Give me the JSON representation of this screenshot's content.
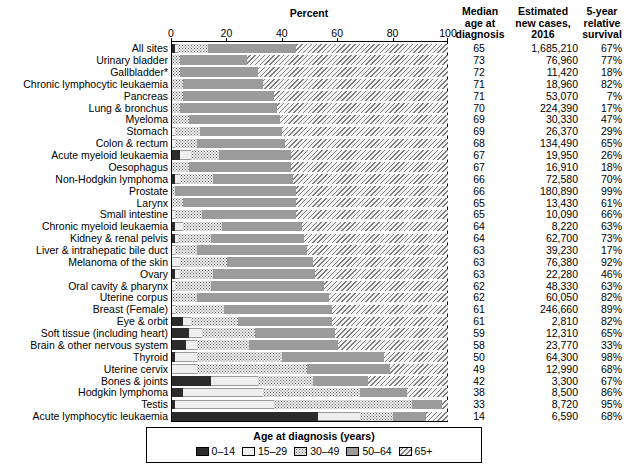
{
  "header": {
    "percent": "Percent",
    "median": "Median\nage at\ndiagnosis",
    "median_l1": "Median",
    "median_l2": "age at",
    "median_l3": "diagnosis",
    "cases_l1": "Estimated",
    "cases_l2": "new cases,",
    "cases_l3": "2016",
    "surv_l1": "5-year",
    "surv_l2": "relative",
    "surv_l3": "survival"
  },
  "legend": {
    "title": "Age at diagnosis (years)",
    "items": [
      {
        "label": "0–14",
        "swatch": "solid-dark",
        "color": "#2b2b2b"
      },
      {
        "label": "15–29",
        "swatch": "light",
        "color": "#eeeeee"
      },
      {
        "label": "30–49",
        "swatch": "dotted",
        "color": "#f2f2f2"
      },
      {
        "label": "50–64",
        "swatch": "solid-gray",
        "color": "#9b9b9b"
      },
      {
        "label": "65+",
        "swatch": "hatched",
        "color": "#f4f4f4"
      }
    ]
  },
  "chart_data": {
    "type": "bar",
    "title": "Percent",
    "xlabel": "Percent",
    "ylabel": "",
    "xlim": [
      0,
      100
    ],
    "xticks": [
      0,
      20,
      40,
      60,
      80,
      100
    ],
    "grid": false,
    "legend_position": "bottom",
    "stacked": true,
    "orientation": "horizontal",
    "series": [
      {
        "name": "0–14",
        "color": "#2b2b2b"
      },
      {
        "name": "15–29",
        "color": "#eeeeee"
      },
      {
        "name": "30–49",
        "color": "#f2f2f2"
      },
      {
        "name": "50–64",
        "color": "#9b9b9b"
      },
      {
        "name": "65+",
        "color": "#f4f4f4"
      }
    ],
    "columns": [
      "Site",
      "0–14",
      "15–29",
      "30–49",
      "50–64",
      "65+",
      "Median age at diagnosis",
      "Estimated new cases, 2016",
      "5-year relative survival"
    ],
    "rows": [
      {
        "label": "All sites",
        "values": [
          1,
          1,
          11,
          32,
          55
        ],
        "median": "65",
        "cases": "1,685,210",
        "survival": "67%"
      },
      {
        "label": "Urinary bladder",
        "values": [
          0,
          0,
          3,
          24,
          73
        ],
        "median": "73",
        "cases": "76,960",
        "survival": "77%"
      },
      {
        "label": "Gallbladder*",
        "values": [
          0,
          0,
          3,
          28,
          69
        ],
        "median": "72",
        "cases": "11,420",
        "survival": "18%"
      },
      {
        "label": "Chronic lymphocytic leukaemia",
        "values": [
          0,
          0,
          4,
          29,
          67
        ],
        "median": "71",
        "cases": "18,960",
        "survival": "82%"
      },
      {
        "label": "Pancreas",
        "values": [
          0,
          0,
          4,
          33,
          63
        ],
        "median": "71",
        "cases": "53,070",
        "survival": "7%"
      },
      {
        "label": "Lung & bronchus",
        "values": [
          0,
          0,
          3,
          35,
          62
        ],
        "median": "70",
        "cases": "224,390",
        "survival": "17%"
      },
      {
        "label": "Myeloma",
        "values": [
          0,
          0,
          6,
          33,
          61
        ],
        "median": "69",
        "cases": "30,330",
        "survival": "47%"
      },
      {
        "label": "Stomach",
        "values": [
          0,
          1,
          9,
          30,
          60
        ],
        "median": "69",
        "cases": "26,370",
        "survival": "29%"
      },
      {
        "label": "Colon & rectum",
        "values": [
          0,
          1,
          8,
          32,
          59
        ],
        "median": "68",
        "cases": "134,490",
        "survival": "65%"
      },
      {
        "label": "Acute myeloid leukaemia",
        "values": [
          3,
          4,
          10,
          26,
          57
        ],
        "median": "67",
        "cases": "19,950",
        "survival": "26%"
      },
      {
        "label": "Oesophagus",
        "values": [
          0,
          0,
          6,
          37,
          57
        ],
        "median": "67",
        "cases": "16,910",
        "survival": "18%"
      },
      {
        "label": "Non-Hodgkin lymphoma",
        "values": [
          1,
          2,
          12,
          29,
          56
        ],
        "median": "66",
        "cases": "72,580",
        "survival": "70%"
      },
      {
        "label": "Prostate",
        "values": [
          0,
          0,
          1,
          44,
          55
        ],
        "median": "66",
        "cases": "180,890",
        "survival": "99%"
      },
      {
        "label": "Larynx",
        "values": [
          0,
          0,
          4,
          41,
          55
        ],
        "median": "65",
        "cases": "13,430",
        "survival": "61%"
      },
      {
        "label": "Small intestine",
        "values": [
          0,
          1,
          10,
          34,
          55
        ],
        "median": "65",
        "cases": "10,090",
        "survival": "66%"
      },
      {
        "label": "Chronic myeloid leukaemia",
        "values": [
          1,
          3,
          14,
          29,
          53
        ],
        "median": "64",
        "cases": "8,220",
        "survival": "63%"
      },
      {
        "label": "Kidney & renal pelvis",
        "values": [
          1,
          1,
          12,
          34,
          52
        ],
        "median": "64",
        "cases": "62,700",
        "survival": "73%"
      },
      {
        "label": "Liver & intrahepatic bile duct",
        "values": [
          0,
          1,
          8,
          40,
          51
        ],
        "median": "63",
        "cases": "39,230",
        "survival": "17%"
      },
      {
        "label": "Melanoma of the skin",
        "values": [
          0,
          3,
          17,
          31,
          49
        ],
        "median": "63",
        "cases": "76,380",
        "survival": "92%"
      },
      {
        "label": "Ovary",
        "values": [
          1,
          2,
          12,
          37,
          48
        ],
        "median": "63",
        "cases": "22,280",
        "survival": "46%"
      },
      {
        "label": "Oral cavity & pharynx",
        "values": [
          0,
          1,
          13,
          41,
          45
        ],
        "median": "62",
        "cases": "48,330",
        "survival": "63%"
      },
      {
        "label": "Uterine corpus",
        "values": [
          0,
          0,
          9,
          48,
          43
        ],
        "median": "62",
        "cases": "60,050",
        "survival": "82%"
      },
      {
        "label": "Breast (Female)",
        "values": [
          0,
          1,
          18,
          39,
          42
        ],
        "median": "61",
        "cases": "246,660",
        "survival": "89%"
      },
      {
        "label": "Eye & orbit",
        "values": [
          4,
          3,
          17,
          34,
          42
        ],
        "median": "61",
        "cases": "2,810",
        "survival": "82%"
      },
      {
        "label": "Soft tissue (including heart)",
        "values": [
          6,
          5,
          19,
          29,
          41
        ],
        "median": "59",
        "cases": "12,310",
        "survival": "65%"
      },
      {
        "label": "Brain & other nervous system",
        "values": [
          5,
          4,
          19,
          32,
          40
        ],
        "median": "58",
        "cases": "23,770",
        "survival": "33%"
      },
      {
        "label": "Thyroid",
        "values": [
          1,
          8,
          31,
          37,
          23
        ],
        "median": "50",
        "cases": "64,300",
        "survival": "98%"
      },
      {
        "label": "Uterine cervix",
        "values": [
          0,
          9,
          40,
          30,
          21
        ],
        "median": "49",
        "cases": "12,990",
        "survival": "68%"
      },
      {
        "label": "Bones & joints",
        "values": [
          14,
          17,
          20,
          20,
          29
        ],
        "median": "42",
        "cases": "3,300",
        "survival": "67%"
      },
      {
        "label": "Hodgkin lymphoma",
        "values": [
          4,
          29,
          35,
          17,
          15
        ],
        "median": "38",
        "cases": "8,500",
        "survival": "86%"
      },
      {
        "label": "Testis",
        "values": [
          1,
          36,
          50,
          11,
          2
        ],
        "median": "33",
        "cases": "8,720",
        "survival": "95%"
      },
      {
        "label": "Acute lymphocytic leukaemia",
        "values": [
          53,
          15,
          12,
          12,
          8
        ],
        "median": "14",
        "cases": "6,590",
        "survival": "68%"
      }
    ]
  }
}
